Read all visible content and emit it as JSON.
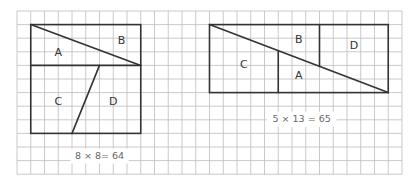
{
  "grid": {
    "x0": 17,
    "y0": 11,
    "cols": 28,
    "rows": 12,
    "cell_w": 13.75,
    "cell_h": 13.6,
    "line_color": "#bdbdbd"
  },
  "colors": {
    "outline": "#333333",
    "grid": "#bdbdbd",
    "formula_text": "#666666",
    "background": "#ffffff"
  },
  "figures": [
    {
      "id": "square",
      "title": "8 × 8 square",
      "formula": "8 × 8 = 64",
      "formula_display": "8 × 8= 64",
      "outline": {
        "c0": 1,
        "r0": 1,
        "c1": 9,
        "r1": 9
      },
      "segments": [
        {
          "name": "horizontal-divider",
          "from": [
            1,
            4
          ],
          "to": [
            9,
            4
          ]
        },
        {
          "name": "diagonal",
          "from": [
            1,
            1
          ],
          "to": [
            9,
            4
          ]
        },
        {
          "name": "slant-divider",
          "from": [
            6,
            4
          ],
          "to": [
            4,
            9
          ]
        }
      ],
      "pieces": [
        {
          "label": "A",
          "at": [
            3,
            3.1
          ]
        },
        {
          "label": "B",
          "at": [
            7.6,
            2.2
          ]
        },
        {
          "label": "C",
          "at": [
            3,
            6.7
          ]
        },
        {
          "label": "D",
          "at": [
            7,
            6.7
          ]
        }
      ],
      "formula_at": [
        6,
        10.7
      ]
    },
    {
      "id": "rectangle",
      "title": "5 × 13 rectangle",
      "formula": "5 × 13 = 65",
      "formula_display": "5 × 13 = 65",
      "outline": {
        "c0": 14,
        "r0": 1,
        "c1": 27,
        "r1": 6
      },
      "segments": [
        {
          "name": "diagonal",
          "from": [
            14,
            1
          ],
          "to": [
            27,
            6
          ]
        },
        {
          "name": "vertical-divider-left",
          "from": [
            19,
            2.92
          ],
          "to": [
            19,
            6
          ]
        },
        {
          "name": "vertical-divider-right",
          "from": [
            22,
            1
          ],
          "to": [
            22,
            4.08
          ]
        }
      ],
      "pieces": [
        {
          "label": "B",
          "at": [
            20.5,
            2.1
          ]
        },
        {
          "label": "D",
          "at": [
            24.5,
            2.6
          ]
        },
        {
          "label": "C",
          "at": [
            16.5,
            4
          ]
        },
        {
          "label": "A",
          "at": [
            20.5,
            4.8
          ]
        }
      ],
      "formula_at": [
        20.7,
        8
      ]
    }
  ]
}
